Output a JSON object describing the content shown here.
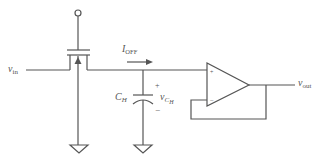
{
  "diagram": {
    "type": "sample-and-hold circuit",
    "colors": {
      "line": "#555555",
      "background": "#ffffff"
    },
    "labels": {
      "vin_main": "v",
      "vin_sub": "in",
      "ioff_main": "I",
      "ioff_sub": "OFF",
      "ch_main": "C",
      "ch_sub": "H",
      "vch_main": "v",
      "vch_sub1": "C",
      "vch_sub2": "H",
      "plus": "+",
      "minus": "−",
      "vout_main": "v",
      "vout_sub": "out",
      "opamp_plus": "+",
      "opamp_minus": "−"
    },
    "components": [
      {
        "id": "switch",
        "kind": "nmos-transistor"
      },
      {
        "id": "hold-capacitor",
        "kind": "capacitor",
        "label": "C_H"
      },
      {
        "id": "buffer",
        "kind": "op-amp",
        "config": "unity-gain follower"
      },
      {
        "id": "ground-1",
        "kind": "ground"
      },
      {
        "id": "ground-2",
        "kind": "ground"
      }
    ]
  }
}
